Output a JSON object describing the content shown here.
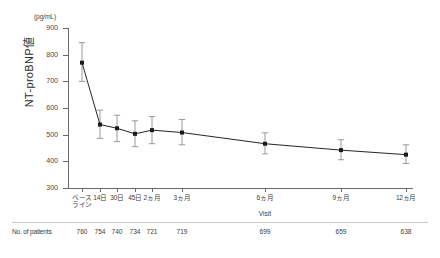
{
  "chart_data": {
    "type": "line",
    "title": "",
    "xlabel": "Visit",
    "ylabel": "NT-proBNP値",
    "yunit": "(pg/mL)",
    "ylim": [
      300,
      900
    ],
    "yticks": [
      300,
      400,
      500,
      600,
      700,
      800,
      900
    ],
    "ytick_labels": [
      "300",
      "400",
      "500",
      "600",
      "700",
      "800",
      "900"
    ],
    "grid": false,
    "legend": "none",
    "categories": [
      "ベース\nライン",
      "14日",
      "30日",
      "45日",
      "2ヵ月",
      "3ヵ月",
      "6ヵ月",
      "9ヵ月",
      "12ヵ月"
    ],
    "category_lines": [
      [
        "ベース",
        "ライン"
      ],
      [
        "14日"
      ],
      [
        "30日"
      ],
      [
        "45日"
      ],
      [
        "2ヵ月"
      ],
      [
        "3ヵ月"
      ],
      [
        "6ヵ月"
      ],
      [
        "9ヵ月"
      ],
      [
        "12ヵ月"
      ]
    ],
    "x_positions_px": [
      82,
      100,
      117,
      135,
      152,
      182,
      265,
      341,
      406
    ],
    "series": [
      {
        "name": "NT-proBNP",
        "values": [
          770,
          538,
          524,
          503,
          517,
          508,
          466,
          442,
          425
        ],
        "err_low": [
          700,
          486,
          474,
          455,
          466,
          462,
          428,
          406,
          392
        ],
        "err_high": [
          845,
          592,
          573,
          552,
          568,
          557,
          507,
          481,
          462
        ],
        "marker": "filled-square",
        "color": "#1a1a1a"
      }
    ],
    "annotations": []
  },
  "footer": {
    "label": "No. of patients",
    "counts": [
      "760",
      "754",
      "740",
      "734",
      "721",
      "719",
      "699",
      "659",
      "638"
    ]
  }
}
